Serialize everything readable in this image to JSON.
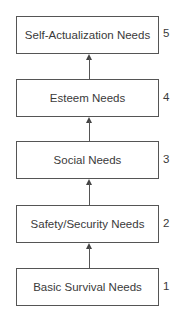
{
  "diagram": {
    "type": "hierarchy-flow",
    "levels": [
      {
        "label": "Self-Actualization Needs",
        "number": "5"
      },
      {
        "label": "Esteem Needs",
        "number": "4"
      },
      {
        "label": "Social Needs",
        "number": "3"
      },
      {
        "label": "Safety/Security Needs",
        "number": "2"
      },
      {
        "label": "Basic Survival Needs",
        "number": "1"
      }
    ],
    "arrow_direction": "up"
  }
}
